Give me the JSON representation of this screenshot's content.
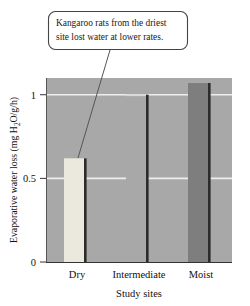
{
  "callout": {
    "line1": "Kangaroo rats from the driest",
    "line2": "site lost water at lower rates."
  },
  "axis": {
    "y_title_part1": "Evaporative water loss (mg H",
    "y_title_sub": "2",
    "y_title_part2": "O/g/h)",
    "x_title": "Study sites",
    "y_ticks": [
      "1",
      "0.5",
      "0"
    ]
  },
  "colors": {
    "plot_background": "#a8a8a8",
    "gridline": "#ededed",
    "bar_dry": "#ebe8de",
    "bar_intermediate": "#a8a8a8",
    "bar_moist": "#7e7e7e",
    "bar_edge": "#2b2b2b",
    "text": "#111111",
    "callout_border": "#444444",
    "page_background": "#ffffff"
  },
  "chart_data": {
    "type": "bar",
    "title": "",
    "categories": [
      "Dry",
      "Intermediate",
      "Moist"
    ],
    "values": [
      0.62,
      1.0,
      1.07
    ],
    "series": [
      {
        "name": "Evaporative water loss",
        "values": [
          0.62,
          1.0,
          1.07
        ]
      }
    ],
    "xlabel": "Study sites",
    "ylabel": "Evaporative water loss (mg H2O/g/h)",
    "ylim": [
      0,
      1.1
    ],
    "yticks": [
      0,
      0.5,
      1
    ],
    "ytick_labels": [
      "0",
      "0.5",
      "1"
    ],
    "grid": true,
    "grid_axis": "y",
    "legend": false,
    "annotations": [
      {
        "text": "Kangaroo rats from the driest site lost water at lower rates.",
        "points_to": "Dry"
      }
    ],
    "bar_colors": [
      "#ebe8de",
      "#a8a8a8",
      "#7e7e7e"
    ]
  }
}
